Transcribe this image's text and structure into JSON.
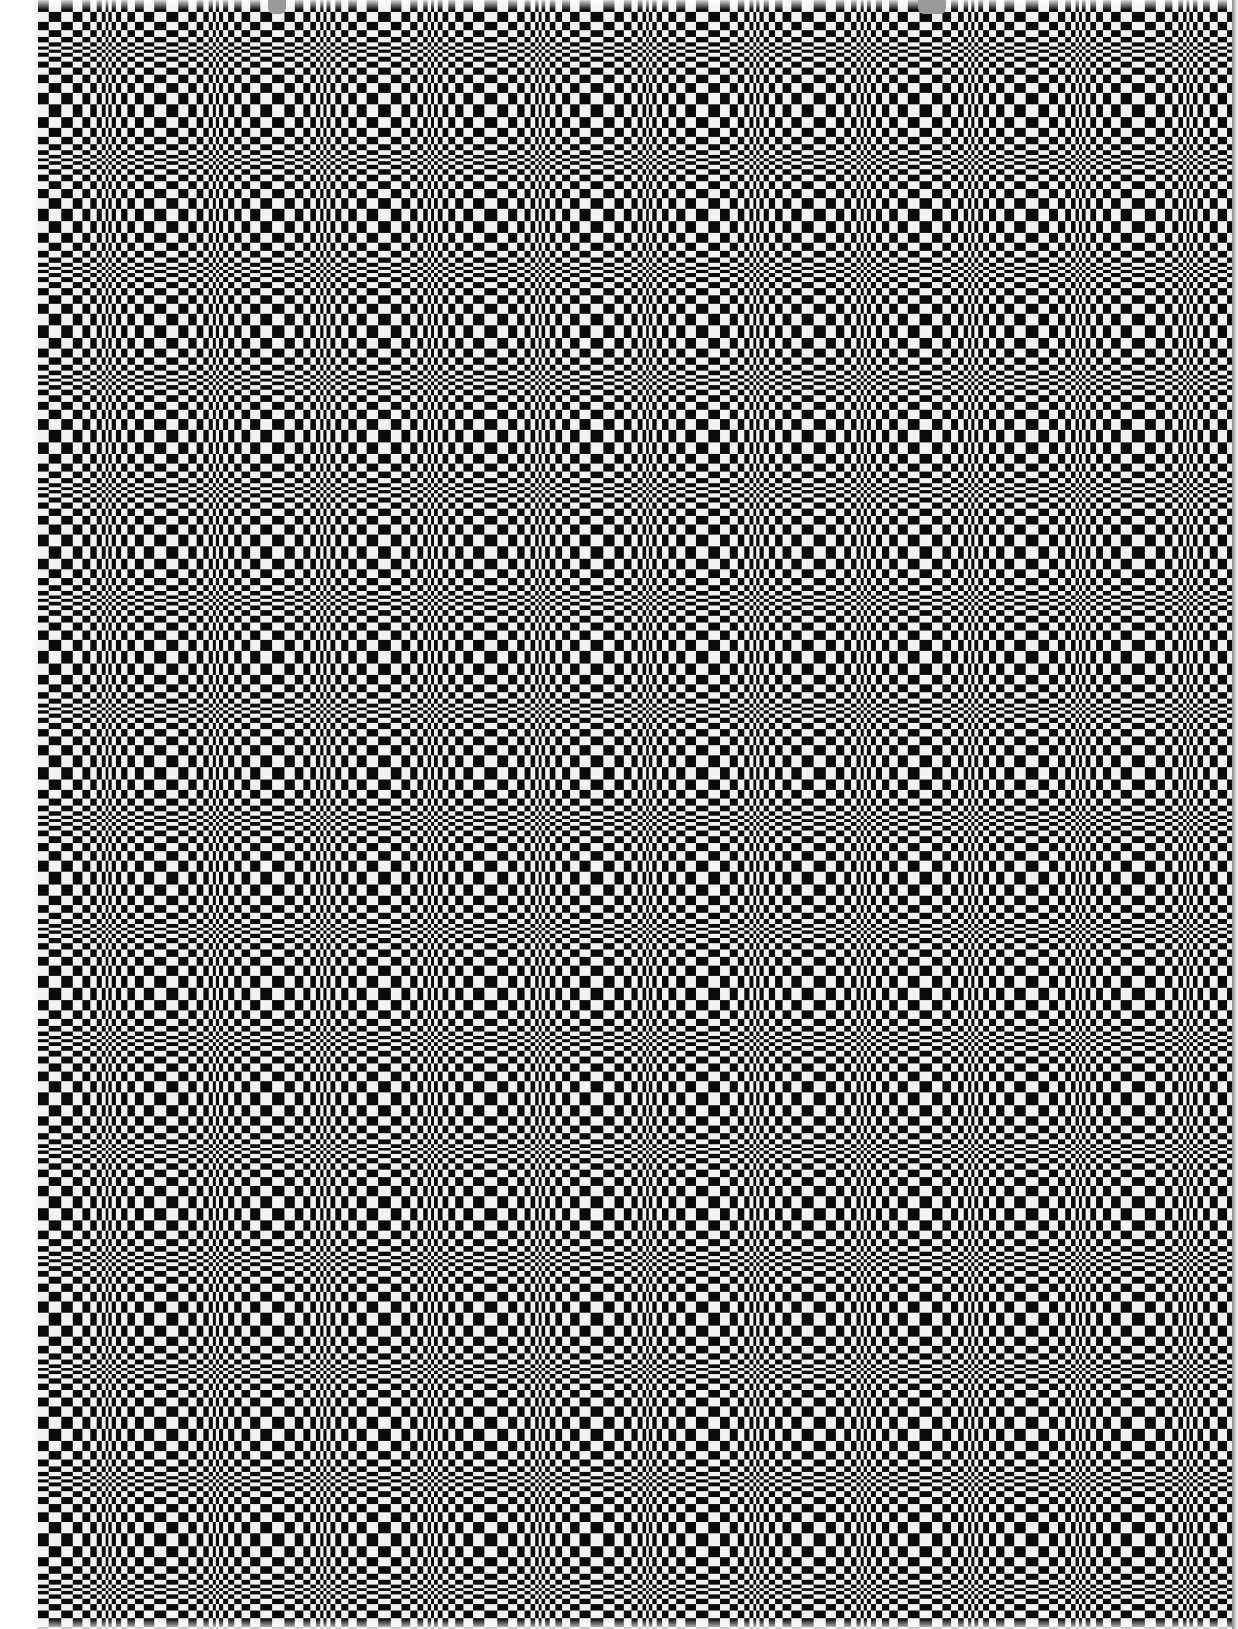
{
  "image": {
    "description": "Warped black-and-white checkerboard optical illusion printed on a sheet",
    "width": 1238,
    "height": 1629
  },
  "sheet": {
    "left": 38,
    "right": 1234,
    "top": 0,
    "bottom": 1629,
    "paper_color": "#f2f2f2",
    "ink_color": "#0a0a0a"
  },
  "pattern": {
    "type": "warped-checkerboard",
    "band_period_x": 108,
    "band_period_y": 110,
    "band_offset_x": 40,
    "band_offset_y": 62,
    "max_cell_size": 13,
    "min_cell_size": 2.5,
    "bands_axis": "both"
  },
  "tabs": [
    {
      "name": "binder-tab-left",
      "left": 268,
      "width": 18,
      "color": "#9a9a9a"
    },
    {
      "name": "binder-tab-right",
      "left": 918,
      "width": 28,
      "color": "#9a9a9a"
    }
  ]
}
